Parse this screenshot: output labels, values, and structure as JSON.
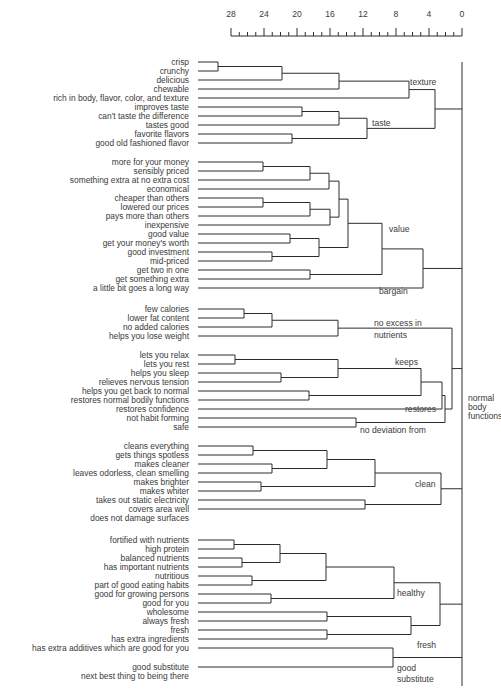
{
  "axis": {
    "ticks": [
      28,
      24,
      20,
      16,
      12,
      8,
      4,
      0
    ],
    "min": 0,
    "max": 28,
    "x_at_max": 231,
    "x_at_zero": 462,
    "y_labels": 17,
    "y_line": 36
  },
  "leaf_x_start": 198,
  "leaf_label_x": 189,
  "leaves": [
    {
      "label": "crisp",
      "y": 62
    },
    {
      "label": "crunchy",
      "y": 71
    },
    {
      "label": "delicious",
      "y": 80
    },
    {
      "label": "chewable",
      "y": 89
    },
    {
      "label": "rich in body, flavor, color, and texture",
      "y": 98
    },
    {
      "label": "improves taste",
      "y": 107
    },
    {
      "label": "can't taste the difference",
      "y": 116
    },
    {
      "label": "tastes good",
      "y": 125
    },
    {
      "label": "favorite flavors",
      "y": 134
    },
    {
      "label": "good old fashioned flavor",
      "y": 143
    },
    {
      "label": "more for your money",
      "y": 162
    },
    {
      "label": "sensibly priced",
      "y": 171
    },
    {
      "label": "something extra at no extra cost",
      "y": 180
    },
    {
      "label": "economical",
      "y": 189
    },
    {
      "label": "cheaper than others",
      "y": 198
    },
    {
      "label": "lowered our prices",
      "y": 207
    },
    {
      "label": "pays more than others",
      "y": 216
    },
    {
      "label": "inexpensive",
      "y": 225
    },
    {
      "label": "good value",
      "y": 234
    },
    {
      "label": "get your money's worth",
      "y": 243
    },
    {
      "label": "good investment",
      "y": 252
    },
    {
      "label": "mid-priced",
      "y": 261
    },
    {
      "label": "get two in one",
      "y": 270
    },
    {
      "label": "get something extra",
      "y": 279
    },
    {
      "label": "a little bit goes a long way",
      "y": 288
    },
    {
      "label": "few calories",
      "y": 309
    },
    {
      "label": "lower fat content",
      "y": 318
    },
    {
      "label": "no added calories",
      "y": 327
    },
    {
      "label": "helps you lose weight",
      "y": 336
    },
    {
      "label": "lets you relax",
      "y": 355
    },
    {
      "label": "lets you rest",
      "y": 364
    },
    {
      "label": "helps you sleep",
      "y": 373
    },
    {
      "label": "relieves nervous tension",
      "y": 382
    },
    {
      "label": "helps you get back to normal",
      "y": 391
    },
    {
      "label": "restores normal bodily functions",
      "y": 400
    },
    {
      "label": "restores confidence",
      "y": 409
    },
    {
      "label": "not habit forming",
      "y": 418
    },
    {
      "label": "safe",
      "y": 427
    },
    {
      "label": "cleans everything",
      "y": 446
    },
    {
      "label": "gets things spotless",
      "y": 455
    },
    {
      "label": "makes cleaner",
      "y": 464
    },
    {
      "label": "leaves odorless, clean smelling",
      "y": 473
    },
    {
      "label": "makes brighter",
      "y": 482
    },
    {
      "label": "makes whiter",
      "y": 491
    },
    {
      "label": "takes out static electricity",
      "y": 500
    },
    {
      "label": "covers area well",
      "y": 509
    },
    {
      "label": "does not damage surfaces",
      "y": 518
    },
    {
      "label": "fortified with nutrients",
      "y": 540
    },
    {
      "label": "high protein",
      "y": 549
    },
    {
      "label": "balanced nutrients",
      "y": 558
    },
    {
      "label": "has important nutrients",
      "y": 567
    },
    {
      "label": "nutritious",
      "y": 576
    },
    {
      "label": "part of good eating habits",
      "y": 585
    },
    {
      "label": "good for growing persons",
      "y": 594
    },
    {
      "label": "good for you",
      "y": 603
    },
    {
      "label": "wholesome",
      "y": 612
    },
    {
      "label": "always fresh",
      "y": 621
    },
    {
      "label": "fresh",
      "y": 630
    },
    {
      "label": "has extra ingredients",
      "y": 639
    },
    {
      "label": "has extra additives which are good for you",
      "y": 648
    },
    {
      "label": "good substitute",
      "y": 667
    },
    {
      "label": "next best thing to being there",
      "y": 676
    }
  ],
  "cluster_labels": [
    {
      "text": "texture",
      "x": 410,
      "y": 85
    },
    {
      "text": "taste",
      "x": 372,
      "y": 126
    },
    {
      "text": "value",
      "x": 389,
      "y": 232
    },
    {
      "text": "bargain",
      "x": 379,
      "y": 294
    },
    {
      "text": "no excess in",
      "x": 374,
      "y": 326
    },
    {
      "text": "nutrients",
      "x": 374,
      "y": 338
    },
    {
      "text": "keeps",
      "x": 395,
      "y": 365
    },
    {
      "text": "restores",
      "x": 405,
      "y": 412
    },
    {
      "text": "no deviation from",
      "x": 360,
      "y": 433
    },
    {
      "text": "clean",
      "x": 415,
      "y": 487
    },
    {
      "text": "healthy",
      "x": 397,
      "y": 596
    },
    {
      "text": "fresh",
      "x": 417,
      "y": 648
    },
    {
      "text": "good",
      "x": 397,
      "y": 671
    },
    {
      "text": "substitute",
      "x": 397,
      "y": 682
    },
    {
      "text": "normal",
      "x": 468,
      "y": 401
    },
    {
      "text": "body",
      "x": 468,
      "y": 410
    },
    {
      "text": "functions",
      "x": 468,
      "y": 419
    }
  ],
  "merges": [
    {
      "id": "a1",
      "x": 218,
      "children": [
        0,
        1
      ]
    },
    {
      "id": "a2",
      "x": 282,
      "children": [
        "a1",
        2
      ]
    },
    {
      "id": "a3",
      "x": 339,
      "children": [
        "a2",
        3
      ]
    },
    {
      "id": "a4",
      "x": 409,
      "children": [
        "a3",
        4
      ]
    },
    {
      "id": "b1",
      "x": 302,
      "children": [
        5,
        6
      ]
    },
    {
      "id": "b2",
      "x": 339,
      "children": [
        "b1",
        7
      ]
    },
    {
      "id": "b3",
      "x": 292,
      "children": [
        8,
        9
      ]
    },
    {
      "id": "b4",
      "x": 367,
      "children": [
        "b2",
        "b3"
      ]
    },
    {
      "id": "tt",
      "x": 435,
      "children": [
        "a4",
        "b4"
      ]
    },
    {
      "id": "v1",
      "x": 263,
      "children": [
        10,
        11
      ]
    },
    {
      "id": "v2",
      "x": 310,
      "children": [
        "v1",
        12
      ]
    },
    {
      "id": "v3",
      "x": 329,
      "children": [
        "v2",
        13
      ]
    },
    {
      "id": "v4",
      "x": 263,
      "children": [
        14,
        15
      ]
    },
    {
      "id": "v5",
      "x": 310,
      "children": [
        "v4",
        16
      ]
    },
    {
      "id": "v6",
      "x": 330,
      "children": [
        "v5",
        17
      ]
    },
    {
      "id": "v7",
      "x": 339,
      "children": [
        "v3",
        "v6"
      ]
    },
    {
      "id": "v8",
      "x": 290,
      "children": [
        18,
        19
      ]
    },
    {
      "id": "v9",
      "x": 272,
      "children": [
        20,
        21
      ]
    },
    {
      "id": "v10",
      "x": 319,
      "children": [
        "v8",
        "v9"
      ]
    },
    {
      "id": "v11",
      "x": 348,
      "children": [
        "v7",
        "v10"
      ]
    },
    {
      "id": "v12",
      "x": 310,
      "children": [
        22,
        23
      ]
    },
    {
      "id": "v13",
      "x": 382,
      "children": [
        "v11",
        "v12"
      ]
    },
    {
      "id": "v14",
      "x": 376,
      "children": [
        24,
        24
      ]
    },
    {
      "id": "vb",
      "x": 423,
      "children": [
        "v13",
        "bg"
      ]
    },
    {
      "id": "n1",
      "x": 244,
      "children": [
        25,
        26
      ]
    },
    {
      "id": "n2",
      "x": 272,
      "children": [
        "n1",
        27
      ]
    },
    {
      "id": "n3",
      "x": 338,
      "children": [
        "n2",
        28
      ]
    },
    {
      "id": "k1",
      "x": 235,
      "children": [
        29,
        30
      ]
    },
    {
      "id": "k2",
      "x": 281,
      "children": [
        31,
        32
      ]
    },
    {
      "id": "k3",
      "x": 338,
      "children": [
        "k1",
        "k2"
      ]
    },
    {
      "id": "r1",
      "x": 309,
      "children": [
        33,
        34
      ]
    },
    {
      "id": "r2",
      "x": 421,
      "children": [
        "k3",
        "r1"
      ]
    },
    {
      "id": "r3",
      "x": 442,
      "children": [
        "r2",
        35
      ]
    },
    {
      "id": "d1",
      "x": 356,
      "children": [
        36,
        37
      ]
    },
    {
      "id": "nb",
      "x": 445,
      "children": [
        "r3",
        "d1"
      ]
    },
    {
      "id": "c1",
      "x": 253,
      "children": [
        38,
        39
      ]
    },
    {
      "id": "c2",
      "x": 272,
      "children": [
        40,
        41
      ]
    },
    {
      "id": "c3",
      "x": 327,
      "children": [
        "c1",
        "c2"
      ]
    },
    {
      "id": "c4",
      "x": 261,
      "children": [
        42,
        43
      ]
    },
    {
      "id": "c5",
      "x": 375,
      "children": [
        "c3",
        "c4"
      ]
    },
    {
      "id": "c6",
      "x": 365,
      "children": [
        44,
        45
      ]
    },
    {
      "id": "c7",
      "x": 441,
      "children": [
        "c5",
        "c6"
      ]
    },
    {
      "id": "h1",
      "x": 234,
      "children": [
        47,
        48
      ]
    },
    {
      "id": "h2",
      "x": 242,
      "children": [
        49,
        50
      ]
    },
    {
      "id": "h3",
      "x": 280,
      "children": [
        "h1",
        "h2"
      ]
    },
    {
      "id": "h4",
      "x": 252,
      "children": [
        51,
        52
      ]
    },
    {
      "id": "h5",
      "x": 326,
      "children": [
        "h3",
        "h4"
      ]
    },
    {
      "id": "h6",
      "x": 271,
      "children": [
        53,
        54
      ]
    },
    {
      "id": "h7",
      "x": 394,
      "children": [
        "h5",
        "h6"
      ]
    },
    {
      "id": "f1",
      "x": 327,
      "children": [
        55,
        56
      ]
    },
    {
      "id": "f2",
      "x": 327,
      "children": [
        57,
        58
      ]
    },
    {
      "id": "f3",
      "x": 411,
      "children": [
        "f1",
        "f2"
      ]
    },
    {
      "id": "hf",
      "x": 440,
      "children": [
        "h7",
        "f3"
      ]
    },
    {
      "id": "gs",
      "x": 393,
      "children": [
        59,
        60
      ]
    }
  ],
  "chart_data": {
    "type": "dendrogram",
    "title": "",
    "xlabel": "Distance",
    "xlim": [
      28,
      0
    ],
    "x_ticks": [
      28,
      24,
      20,
      16,
      12,
      8,
      4,
      0
    ],
    "clusters": [
      {
        "name": "texture",
        "members": [
          "crisp",
          "crunchy",
          "delicious",
          "chewable",
          "rich in body, flavor, color, and texture"
        ]
      },
      {
        "name": "taste",
        "members": [
          "improves taste",
          "can't taste the difference",
          "tastes good",
          "favorite flavors",
          "good old fashioned flavor"
        ]
      },
      {
        "name": "value",
        "members": [
          "more for your money",
          "sensibly priced",
          "something extra at no extra cost",
          "economical",
          "cheaper than others",
          "lowered our prices",
          "pays more than others",
          "inexpensive",
          "good value",
          "get your money's worth",
          "good investment",
          "mid-priced",
          "get two in one",
          "get something extra"
        ]
      },
      {
        "name": "bargain",
        "members": [
          "a little bit goes a long way"
        ]
      },
      {
        "name": "no excess in nutrients",
        "members": [
          "few calories",
          "lower fat content",
          "no added calories",
          "helps you lose weight"
        ]
      },
      {
        "name": "keeps",
        "members": [
          "lets you relax",
          "lets you rest",
          "helps you sleep",
          "relieves nervous tension"
        ]
      },
      {
        "name": "restores",
        "members": [
          "helps you get back to normal",
          "restores normal bodily functions",
          "restores confidence"
        ]
      },
      {
        "name": "no deviation from",
        "members": [
          "not habit forming",
          "safe"
        ]
      },
      {
        "name": "normal body functions",
        "members": [
          "no excess in nutrients",
          "keeps",
          "restores",
          "no deviation from"
        ]
      },
      {
        "name": "clean",
        "members": [
          "cleans everything",
          "gets things spotless",
          "makes cleaner",
          "leaves odorless, clean smelling",
          "makes brighter",
          "makes whiter",
          "takes out static electricity",
          "covers area well",
          "does not damage surfaces"
        ]
      },
      {
        "name": "healthy",
        "members": [
          "fortified with nutrients",
          "high protein",
          "balanced nutrients",
          "has important nutrients",
          "nutritious",
          "part of good eating habits",
          "good for growing persons",
          "good for you",
          "wholesome"
        ]
      },
      {
        "name": "fresh",
        "members": [
          "always fresh",
          "fresh",
          "has extra ingredients",
          "has extra additives which are good for you"
        ]
      },
      {
        "name": "good substitute",
        "members": [
          "good substitute",
          "next best thing to being there"
        ]
      }
    ]
  }
}
